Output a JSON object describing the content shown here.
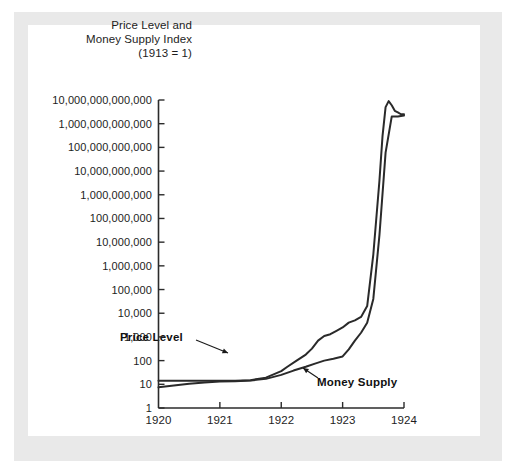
{
  "figure": {
    "title_lines": [
      "Price Level and",
      "Money Supply Index",
      "(1913 = 1)"
    ],
    "frame_color": "#e9e9e9",
    "panel_color": "#ffffff",
    "line_color": "#2a2a2a"
  },
  "chart_data": {
    "type": "line",
    "title": "Price Level and Money Supply Index (1913 = 1)",
    "xlabel": "",
    "ylabel": "Price Level and Money Supply Index (1913 = 1)",
    "yscale": "log",
    "ylim": [
      1,
      10000000000000
    ],
    "xlim": [
      1920,
      1924
    ],
    "grid": false,
    "legend_position": "inline-annotations",
    "ytick_labels": [
      "10,000,000,000,000",
      "1,000,000,000,000",
      "100,000,000,000",
      "10,000,000,000",
      "1,000,000,000",
      "100,000,000",
      "10,000,000",
      "1,000,000",
      "100,000",
      "10,000",
      "1,000",
      "100",
      "10",
      "1"
    ],
    "ytick_values": [
      10000000000000,
      1000000000000,
      100000000000,
      10000000000,
      1000000000,
      100000000,
      10000000,
      1000000,
      100000,
      10000,
      1000,
      100,
      10,
      1
    ],
    "xtick_labels": [
      "1920",
      "1921",
      "1922",
      "1923",
      "1924"
    ],
    "xtick_values": [
      1920,
      1921,
      1922,
      1923,
      1924
    ],
    "annotations": [
      {
        "text": "Price Level",
        "points_to_series": "Price Level",
        "at_x": 1922.15
      },
      {
        "text": "Money Supply",
        "points_to_series": "Money Supply",
        "at_x": 1922.75
      }
    ],
    "series": [
      {
        "name": "Price Level",
        "color": "#2a2a2a",
        "x": [
          1920.0,
          1920.25,
          1920.5,
          1920.75,
          1921.0,
          1921.25,
          1921.5,
          1921.75,
          1922.0,
          1922.1,
          1922.25,
          1922.4,
          1922.5,
          1922.6,
          1922.7,
          1922.8,
          1922.9,
          1923.0,
          1923.1,
          1923.2,
          1923.3,
          1923.4,
          1923.5,
          1923.6,
          1923.65,
          1923.7,
          1923.75,
          1923.8,
          1923.85,
          1923.9,
          1923.95,
          1924.0
        ],
        "y": [
          14,
          14,
          14,
          14,
          14,
          14,
          15,
          19,
          36,
          55,
          100,
          180,
          320,
          700,
          1100,
          1300,
          1800,
          2500,
          4000,
          5000,
          7000,
          20000,
          3000000,
          4000000000,
          300000000000,
          5000000000000,
          9000000000000,
          6000000000000,
          3500000000000,
          3000000000000,
          2500000000000,
          2500000000000
        ]
      },
      {
        "name": "Money Supply",
        "color": "#2a2a2a",
        "x": [
          1920.0,
          1920.25,
          1920.5,
          1920.75,
          1921.0,
          1921.25,
          1921.5,
          1921.75,
          1922.0,
          1922.2,
          1922.4,
          1922.55,
          1922.7,
          1922.85,
          1923.0,
          1923.1,
          1923.2,
          1923.3,
          1923.4,
          1923.5,
          1923.6,
          1923.7,
          1923.8,
          1923.9,
          1924.0
        ],
        "y": [
          7.5,
          9,
          10.5,
          12,
          13,
          13.5,
          14.5,
          17,
          25,
          38,
          55,
          75,
          100,
          120,
          150,
          300,
          700,
          1500,
          4000,
          40000,
          20000000,
          60000000000,
          2000000000000,
          2000000000000,
          2200000000000
        ]
      }
    ]
  }
}
